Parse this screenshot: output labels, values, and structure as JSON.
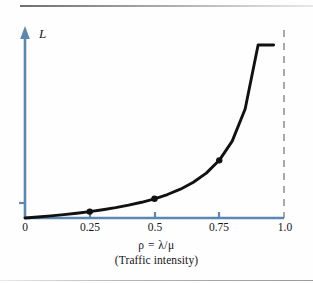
{
  "figure": {
    "background_color": "#fefefe",
    "axis_color": "#5b87b0",
    "curve_color": "#111111",
    "asymptote_color": "#a9a9ab",
    "label_color": "#151517"
  },
  "axes": {
    "y_label": "L",
    "x_caption_line1": "ρ  =  λ/μ",
    "x_caption_line2": "(Traffic intensity)"
  },
  "chart_data": {
    "type": "line",
    "title": "",
    "xlabel": "ρ = λ/μ (Traffic intensity)",
    "ylabel": "L",
    "xlim": [
      0,
      1.0
    ],
    "ylim": [
      0,
      9
    ],
    "grid": false,
    "legend": "none",
    "xticks": [
      0,
      0.25,
      0.5,
      0.75,
      1.0
    ],
    "xtick_labels": [
      "0",
      "0.25",
      "0.5",
      "0.75",
      "1.0"
    ],
    "yticks": [
      0.3333
    ],
    "ytick_labels": [
      ""
    ],
    "annotations": [
      {
        "text": "vertical asymptote at ρ = 1.0",
        "style": "gray dashed line"
      }
    ],
    "series": [
      {
        "name": "L = ρ/(1−ρ)",
        "x": [
          0,
          0.05,
          0.1,
          0.15,
          0.2,
          0.25,
          0.3,
          0.35,
          0.4,
          0.45,
          0.5,
          0.55,
          0.6,
          0.65,
          0.7,
          0.75,
          0.8,
          0.85,
          0.9,
          0.93,
          0.95,
          0.96
        ],
        "y": [
          0,
          0.053,
          0.111,
          0.176,
          0.25,
          0.333,
          0.429,
          0.538,
          0.667,
          0.818,
          1.0,
          1.222,
          1.5,
          1.857,
          2.333,
          3.0,
          4.0,
          5.667,
          9.0,
          13.29,
          19.0,
          24.0
        ]
      }
    ],
    "markers": [
      {
        "x": 0.25,
        "y": 0.333
      },
      {
        "x": 0.5,
        "y": 1.0
      },
      {
        "x": 0.75,
        "y": 3.0
      }
    ]
  }
}
